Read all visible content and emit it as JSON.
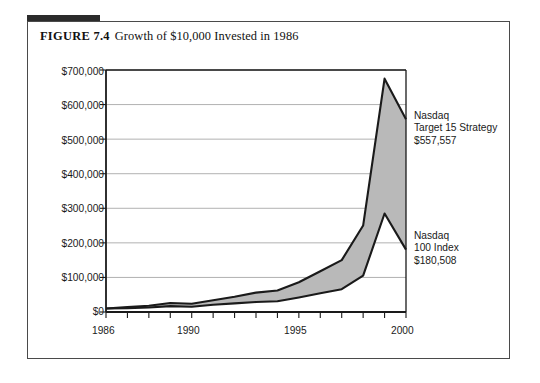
{
  "figure": {
    "label": "FIGURE 7.4",
    "title": "Growth of $10,000 Invested in 1986"
  },
  "annotations": {
    "upper": {
      "line1": "Nasdaq",
      "line2": "Target 15 Strategy",
      "line3": "$557,557"
    },
    "lower": {
      "line1": "Nasdaq",
      "line2": "100 Index",
      "line3": "$180,508"
    }
  },
  "colors": {
    "band_fill": "#b9b9b9",
    "line": "#1a1a1a",
    "grid": "#a8a8a8",
    "axis": "#1a1a1a",
    "frame": "#4a4a4a",
    "accent_bar": "#2b2b2b"
  },
  "chart_data": {
    "type": "area",
    "title": "Growth of $10,000 Invested in 1986",
    "xlabel": "",
    "ylabel": "",
    "x": [
      1986,
      1987,
      1988,
      1989,
      1990,
      1991,
      1992,
      1993,
      1994,
      1995,
      1996,
      1997,
      1998,
      1999,
      2000
    ],
    "xlim": [
      1986,
      2000
    ],
    "ylim": [
      0,
      700000
    ],
    "xticks": [
      1986,
      1987,
      1988,
      1989,
      1990,
      1991,
      1992,
      1993,
      1994,
      1995,
      1996,
      1997,
      1998,
      1999,
      2000
    ],
    "xtick_labels_shown": [
      "1986",
      "1990",
      "1995",
      "2000"
    ],
    "yticks": [
      0,
      100000,
      200000,
      300000,
      400000,
      500000,
      600000,
      700000
    ],
    "ytick_labels": [
      "$0",
      "$100,000",
      "$200,000",
      "$300,000",
      "$400,000",
      "$500,000",
      "$600,000",
      "$700,000"
    ],
    "grid": true,
    "legend": "annotations-at-right",
    "series": [
      {
        "name": "Nasdaq Target 15 Strategy",
        "final_value": 557557,
        "final_value_label": "$557,557",
        "values": [
          10000,
          14000,
          18000,
          26000,
          24000,
          34000,
          44000,
          56000,
          62000,
          86000,
          118000,
          150000,
          250000,
          675000,
          557557
        ]
      },
      {
        "name": "Nasdaq 100 Index",
        "final_value": 180508,
        "final_value_label": "$180,508",
        "values": [
          10000,
          11000,
          13000,
          17000,
          15000,
          21000,
          25000,
          29000,
          31000,
          42000,
          54000,
          66000,
          105000,
          285000,
          180508
        ]
      }
    ]
  }
}
